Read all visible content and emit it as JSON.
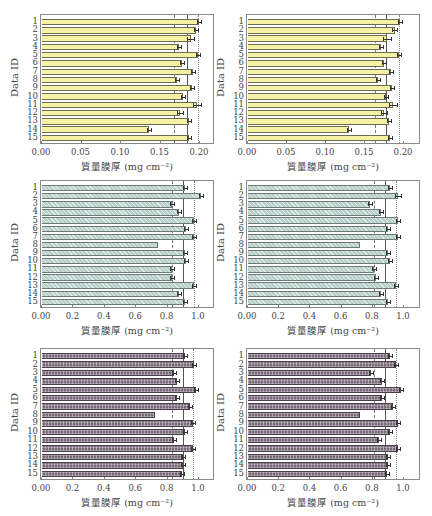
{
  "chart_data": [
    {
      "type": "bar",
      "orientation": "horizontal",
      "panel": "top-left",
      "style": "yellow",
      "title": "",
      "xlabel": "質量膜厚 (mg cm⁻²)",
      "ylabel": "Data ID",
      "categories": [
        "1",
        "2",
        "3",
        "4",
        "5",
        "6",
        "7",
        "8",
        "9",
        "10",
        "11",
        "12",
        "13",
        "14",
        "15"
      ],
      "values": [
        0.199,
        0.195,
        0.188,
        0.173,
        0.197,
        0.177,
        0.191,
        0.171,
        0.19,
        0.179,
        0.196,
        0.175,
        0.186,
        0.136,
        0.186
      ],
      "errors": [
        0.001,
        0.003,
        0.005,
        0.001,
        0.001,
        0.001,
        0.002,
        0.001,
        0.001,
        0.001,
        0.005,
        0.004,
        0.001,
        0.001,
        0.001
      ],
      "xlim": [
        0.0,
        0.22
      ],
      "xticks": [
        "0.00",
        "0.05",
        "0.10",
        "0.15",
        "0.20"
      ],
      "xtick_values": [
        0.0,
        0.05,
        0.1,
        0.15,
        0.2
      ],
      "reference_lines": [
        {
          "style": "dashed",
          "value": 0.167
        },
        {
          "style": "solid",
          "value": 0.183
        },
        {
          "style": "dotted",
          "value": 0.198
        }
      ],
      "grid": false
    },
    {
      "type": "bar",
      "orientation": "horizontal",
      "panel": "top-right",
      "style": "yellow",
      "title": "",
      "xlabel": "質量膜厚 (mg cm⁻²)",
      "ylabel": "Data ID",
      "categories": [
        "1",
        "2",
        "3",
        "4",
        "5",
        "6",
        "7",
        "8",
        "9",
        "10",
        "11",
        "12",
        "13",
        "14",
        "15"
      ],
      "values": [
        0.195,
        0.188,
        0.178,
        0.17,
        0.194,
        0.174,
        0.183,
        0.167,
        0.184,
        0.177,
        0.186,
        0.174,
        0.181,
        0.13,
        0.182
      ],
      "errors": [
        0.001,
        0.003,
        0.005,
        0.001,
        0.001,
        0.001,
        0.001,
        0.001,
        0.001,
        0.001,
        0.005,
        0.004,
        0.001,
        0.002,
        0.001
      ],
      "xlim": [
        0.0,
        0.22
      ],
      "xticks": [
        "0.00",
        "0.05",
        "0.10",
        "0.15",
        "0.20"
      ],
      "xtick_values": [
        0.0,
        0.05,
        0.1,
        0.15,
        0.2
      ],
      "reference_lines": [
        {
          "style": "dashed",
          "value": 0.163
        },
        {
          "style": "solid",
          "value": 0.177
        },
        {
          "style": "dotted",
          "value": 0.193
        }
      ],
      "grid": false
    },
    {
      "type": "bar",
      "orientation": "horizontal",
      "panel": "middle-left",
      "style": "teal",
      "title": "",
      "xlabel": "質量膜厚 (mg cm⁻²)",
      "ylabel": "Data ID",
      "categories": [
        "1",
        "2",
        "3",
        "4",
        "5",
        "6",
        "7",
        "8",
        "9",
        "10",
        "11",
        "12",
        "13",
        "14",
        "15"
      ],
      "values": [
        0.91,
        1.01,
        0.83,
        0.87,
        0.97,
        0.92,
        0.97,
        0.74,
        0.91,
        0.92,
        0.83,
        0.83,
        0.97,
        0.87,
        0.91
      ],
      "errors": [
        0.005,
        0.01,
        0.005,
        0.005,
        0.005,
        0.005,
        0.005,
        0.0,
        0.005,
        0.01,
        0.005,
        0.005,
        0.005,
        0.01,
        0.01
      ],
      "xlim": [
        0.0,
        1.1
      ],
      "xticks": [
        "0.00",
        "0.2",
        "0.4",
        "0.6",
        "0.8",
        "1.0"
      ],
      "xtick_values": [
        0.0,
        0.2,
        0.4,
        0.6,
        0.8,
        1.0
      ],
      "reference_lines": [
        {
          "style": "dashed",
          "value": 0.83
        },
        {
          "style": "solid",
          "value": 0.9
        },
        {
          "style": "dotted",
          "value": 0.97
        }
      ],
      "grid": false
    },
    {
      "type": "bar",
      "orientation": "horizontal",
      "panel": "middle-right",
      "style": "teal",
      "title": "",
      "xlabel": "質量膜厚 (mg cm⁻²)",
      "ylabel": "Data ID",
      "categories": [
        "1",
        "2",
        "3",
        "4",
        "5",
        "6",
        "7",
        "8",
        "9",
        "10",
        "11",
        "12",
        "13",
        "14",
        "15"
      ],
      "values": [
        0.91,
        0.96,
        0.78,
        0.85,
        0.96,
        0.9,
        0.96,
        0.72,
        0.9,
        0.91,
        0.81,
        0.82,
        0.95,
        0.85,
        0.9
      ],
      "errors": [
        0.005,
        0.02,
        0.005,
        0.005,
        0.005,
        0.005,
        0.005,
        0.0,
        0.005,
        0.01,
        0.005,
        0.005,
        0.005,
        0.01,
        0.01
      ],
      "xlim": [
        0.0,
        1.1
      ],
      "xticks": [
        "0.00",
        "0.2",
        "0.4",
        "0.6",
        "0.8",
        "1.0"
      ],
      "xtick_values": [
        0.0,
        0.2,
        0.4,
        0.6,
        0.8,
        1.0
      ],
      "reference_lines": [
        {
          "style": "dashed",
          "value": 0.81
        },
        {
          "style": "solid",
          "value": 0.88
        },
        {
          "style": "dotted",
          "value": 0.95
        }
      ],
      "grid": false
    },
    {
      "type": "bar",
      "orientation": "horizontal",
      "panel": "bottom-left",
      "style": "purple",
      "title": "",
      "xlabel": "質量膜厚 (mg cm⁻²)",
      "ylabel": "Data ID",
      "categories": [
        "1",
        "2",
        "3",
        "4",
        "5",
        "6",
        "7",
        "8",
        "9",
        "10",
        "11",
        "12",
        "13",
        "14",
        "15"
      ],
      "values": [
        0.91,
        0.97,
        0.84,
        0.86,
        0.98,
        0.86,
        0.94,
        0.72,
        0.96,
        0.91,
        0.84,
        0.96,
        0.9,
        0.9,
        0.89
      ],
      "errors": [
        0.005,
        0.01,
        0.005,
        0.005,
        0.005,
        0.005,
        0.005,
        0.0,
        0.005,
        0.005,
        0.005,
        0.005,
        0.005,
        0.01,
        0.005
      ],
      "xlim": [
        0.0,
        1.1
      ],
      "xticks": [
        "0.00",
        "0.2",
        "0.4",
        "0.6",
        "0.8",
        "1.0"
      ],
      "xtick_values": [
        0.0,
        0.2,
        0.4,
        0.6,
        0.8,
        1.0
      ],
      "reference_lines": [
        {
          "style": "dashed",
          "value": 0.83
        },
        {
          "style": "solid",
          "value": 0.895
        },
        {
          "style": "dotted",
          "value": 0.96
        }
      ],
      "grid": false
    },
    {
      "type": "bar",
      "orientation": "horizontal",
      "panel": "bottom-right",
      "style": "purple",
      "title": "",
      "xlabel": "質量膜厚 (mg cm⁻²)",
      "ylabel": "Data ID",
      "categories": [
        "1",
        "2",
        "3",
        "4",
        "5",
        "6",
        "7",
        "8",
        "9",
        "10",
        "11",
        "12",
        "13",
        "14",
        "15"
      ],
      "values": [
        0.91,
        0.95,
        0.79,
        0.86,
        0.98,
        0.86,
        0.93,
        0.72,
        0.96,
        0.91,
        0.84,
        0.96,
        0.9,
        0.9,
        0.89
      ],
      "errors": [
        0.005,
        0.01,
        0.005,
        0.005,
        0.005,
        0.005,
        0.005,
        0.0,
        0.005,
        0.005,
        0.005,
        0.005,
        0.005,
        0.01,
        0.005
      ],
      "xlim": [
        0.0,
        1.1
      ],
      "xticks": [
        "0.00",
        "0.2",
        "0.4",
        "0.6",
        "0.8",
        "1.0"
      ],
      "xtick_values": [
        0.0,
        0.2,
        0.4,
        0.6,
        0.8,
        1.0
      ],
      "reference_lines": [
        {
          "style": "dashed",
          "value": 0.81
        },
        {
          "style": "solid",
          "value": 0.88
        },
        {
          "style": "dotted",
          "value": 0.95
        }
      ],
      "grid": false
    }
  ],
  "layout": {
    "panels": [
      {
        "left": 0,
        "top": 0,
        "frame": {
          "x": 40,
          "y": 14,
          "w": 174,
          "h": 130
        },
        "axis_x0": 41,
        "px_per_unit": 790
      },
      {
        "left": 216,
        "top": 0,
        "frame": {
          "x": 30,
          "y": 14,
          "w": 174,
          "h": 130
        },
        "axis_x0": 31,
        "px_per_unit": 780
      },
      {
        "left": 0,
        "top": 172,
        "frame": {
          "x": 40,
          "y": 8,
          "w": 174,
          "h": 128
        },
        "axis_x0": 41,
        "px_per_unit": 157
      },
      {
        "left": 216,
        "top": 172,
        "frame": {
          "x": 30,
          "y": 8,
          "w": 174,
          "h": 128
        },
        "axis_x0": 31,
        "px_per_unit": 156
      },
      {
        "left": 0,
        "top": 344,
        "frame": {
          "x": 40,
          "y": 4,
          "w": 174,
          "h": 132
        },
        "axis_x0": 41,
        "px_per_unit": 157
      },
      {
        "left": 216,
        "top": 344,
        "frame": {
          "x": 30,
          "y": 4,
          "w": 174,
          "h": 132
        },
        "axis_x0": 31,
        "px_per_unit": 156
      }
    ]
  }
}
